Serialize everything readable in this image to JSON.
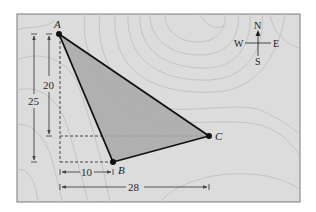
{
  "diagram": {
    "type": "map-triangle",
    "colors": {
      "frame_fill": "#dcdcdc",
      "frame_border": "#7a7a7a",
      "triangle_fill": "#a8a8a8",
      "triangle_stroke": "#111111",
      "contour": "#bdbdbd",
      "dim_line": "#444444"
    },
    "points": {
      "A": {
        "label": "A",
        "x": 59,
        "y": 34
      },
      "B": {
        "label": "B",
        "x": 113,
        "y": 162
      },
      "C": {
        "label": "C",
        "x": 209,
        "y": 136
      }
    },
    "dimensions": {
      "vertical_25": {
        "label": "25",
        "value": 25
      },
      "vertical_20": {
        "label": "20",
        "value": 20
      },
      "horizontal_10": {
        "label": "10",
        "value": 10
      },
      "horizontal_28": {
        "label": "28",
        "value": 28
      }
    },
    "compass": {
      "north": "N",
      "south": "S",
      "east": "E",
      "west": "W"
    }
  }
}
